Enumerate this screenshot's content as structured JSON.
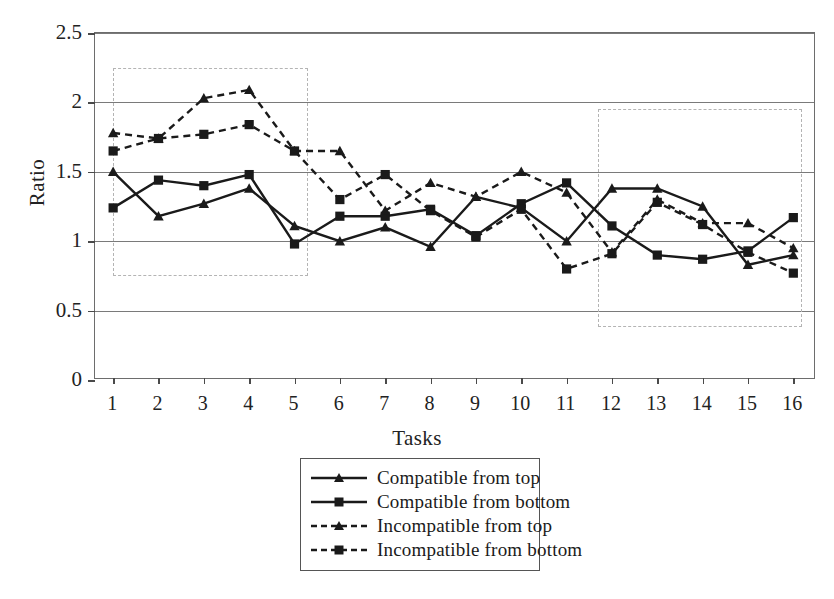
{
  "chart_data": {
    "type": "line",
    "title": "",
    "xlabel": "Tasks",
    "ylabel": "Ratio",
    "categories": [
      1,
      2,
      3,
      4,
      5,
      6,
      7,
      8,
      9,
      10,
      11,
      12,
      13,
      14,
      15,
      16
    ],
    "xlim": [
      0.6,
      16.5
    ],
    "ylim": [
      0,
      2.5
    ],
    "yticks": [
      "0",
      "0.5",
      "1",
      "1.5",
      "2",
      "2.5"
    ],
    "ytick_values": [
      0,
      0.5,
      1,
      1.5,
      2,
      2.5
    ],
    "xticks": [
      "1",
      "2",
      "3",
      "4",
      "5",
      "6",
      "7",
      "8",
      "9",
      "10",
      "11",
      "12",
      "13",
      "14",
      "15",
      "16"
    ],
    "grid": "horizontal",
    "legend_position": "below-center",
    "series": [
      {
        "name": "Compatible from top",
        "style": "solid",
        "marker": "triangle",
        "color": "#1a1a1a",
        "values": [
          1.5,
          1.18,
          1.27,
          1.38,
          1.11,
          1.0,
          1.1,
          0.96,
          1.32,
          1.24,
          1.0,
          1.38,
          1.38,
          1.25,
          0.83,
          0.9
        ]
      },
      {
        "name": "Compatible from bottom",
        "style": "solid",
        "marker": "square",
        "color": "#1a1a1a",
        "values": [
          1.24,
          1.44,
          1.4,
          1.48,
          0.98,
          1.18,
          1.18,
          1.23,
          1.04,
          1.27,
          1.42,
          1.11,
          0.9,
          0.87,
          0.93,
          1.17
        ]
      },
      {
        "name": "Incompatible from top",
        "style": "dashed",
        "marker": "triangle",
        "color": "#1a1a1a",
        "values": [
          1.78,
          1.74,
          2.03,
          2.09,
          1.65,
          1.65,
          1.22,
          1.42,
          1.32,
          1.5,
          1.35,
          0.92,
          1.3,
          1.13,
          1.13,
          0.95
        ]
      },
      {
        "name": "Incompatible from bottom",
        "style": "dashed",
        "marker": "square",
        "color": "#1a1a1a",
        "values": [
          1.65,
          1.74,
          1.77,
          1.84,
          1.65,
          1.3,
          1.48,
          1.22,
          1.03,
          1.23,
          0.8,
          0.91,
          1.28,
          1.12,
          0.92,
          0.77
        ]
      }
    ],
    "annotations": [
      {
        "type": "dashed-box",
        "name": "highlight-box-left",
        "x0": 1.0,
        "x1": 5.3,
        "y0": 0.75,
        "y1": 2.25
      },
      {
        "type": "dashed-box",
        "name": "highlight-box-right",
        "x0": 11.7,
        "x1": 16.2,
        "y0": 0.38,
        "y1": 1.95
      }
    ]
  },
  "axes": {
    "ylabel": "Ratio",
    "xlabel": "Tasks"
  },
  "legend": {
    "items": [
      {
        "label": "Compatible from top"
      },
      {
        "label": "Compatible from bottom"
      },
      {
        "label": "Incompatible from top"
      },
      {
        "label": "Incompatible from bottom"
      }
    ]
  }
}
